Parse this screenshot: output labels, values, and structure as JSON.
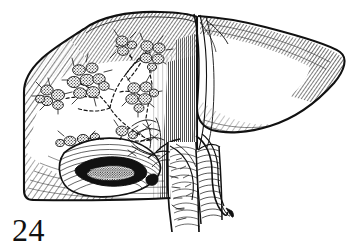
{
  "figure": {
    "number_label": "24",
    "caption": "",
    "subject": "liver",
    "style": "pen-and-ink line engraving",
    "background_color": "#ffffff",
    "ink_color": "#111111",
    "width_px": 356,
    "height_px": 250
  },
  "illustration": {
    "title": "Anatomical line drawing of the liver with intrahepatic biliary tree and nodular deposits",
    "view": "anterior-inferior view, right lobe sectioned to reveal biliary radicles",
    "regions": [
      {
        "name": "right-lobe",
        "label": "Right lobe of liver",
        "description": "Large dome-shaped mass occupying the left two thirds of the drawing, outlined with a heavy contour and shaded by dense parallel hatching along the superior and inferior borders.",
        "shading": "graduated parallel hatching",
        "interactable": false
      },
      {
        "name": "left-lobe",
        "label": "Left lobe of liver",
        "description": "Smaller tongue-shaped lobe extending to the right, tapering to a thin pointed tip, shaded with fine curved hatching along its free margins.",
        "shading": "curved contour hatching",
        "interactable": false
      },
      {
        "name": "falciform-ligament",
        "label": "Falciform ligament",
        "description": "Vertical band of dense short hatching separating the right and left lobes.",
        "shading": "dense vertical hatching",
        "interactable": false
      },
      {
        "name": "gallbladder",
        "label": "Gallbladder",
        "description": "Ovoid sac on the inferior surface of the right lobe, opened to show a dark stippled interior cavity.",
        "shading": "solid black cavity with contour hatching",
        "interactable": false
      },
      {
        "name": "biliary-tree",
        "label": "Intrahepatic bile ducts",
        "description": "Dashed branching duct system spreading through the right lobe from the hilum toward the periphery.",
        "shading": "dashed outline",
        "interactable": false
      },
      {
        "name": "nodule-clusters",
        "label": "Nodular deposits along bile ducts",
        "description": "Grape-like clusters of stippled rounded nodules sited at duct bifurcations and terminations, each with fine radiating ductules.",
        "shading": "cross-hatched stipple",
        "interactable": false
      },
      {
        "name": "porta-hepatis",
        "label": "Porta hepatis",
        "description": "Hilar region where the vessels and ducts enter the liver, drawn with tangled fine linework.",
        "shading": "fine irregular linework",
        "interactable": false
      },
      {
        "name": "portal-vein",
        "label": "Portal vein",
        "description": "Broad vertical vessel descending from the hilum, shaded with close horizontal ring hatching.",
        "shading": "horizontal ring hatching",
        "interactable": false
      },
      {
        "name": "bile-duct",
        "label": "Common bile duct",
        "description": "Slender tube running alongside the portal vein and passing inferiorly.",
        "shading": "outline with sparse hatching",
        "interactable": false
      },
      {
        "name": "hepatic-artery",
        "label": "Hepatic artery",
        "description": "Thin branching vessel crossing in front of the portal vein at the hilum.",
        "shading": "thin outline",
        "interactable": false
      },
      {
        "name": "inferior-vena-cava",
        "label": "Inferior vena cava",
        "description": "Wide vessel behind the liver descending at the right of the hilar group with dense ring hatching.",
        "shading": "dense horizontal ring hatching",
        "interactable": false
      }
    ],
    "nodule_clusters": [
      {
        "id": 1,
        "cx": 52,
        "cy": 96,
        "count": 5
      },
      {
        "id": 2,
        "cx": 88,
        "cy": 83,
        "count": 8
      },
      {
        "id": 3,
        "cx": 123,
        "cy": 45,
        "count": 3
      },
      {
        "id": 4,
        "cx": 151,
        "cy": 54,
        "count": 5
      },
      {
        "id": 5,
        "cx": 140,
        "cy": 95,
        "count": 6
      },
      {
        "id": 6,
        "cx": 77,
        "cy": 141,
        "count": 4
      },
      {
        "id": 7,
        "cx": 124,
        "cy": 133,
        "count": 2
      }
    ]
  }
}
